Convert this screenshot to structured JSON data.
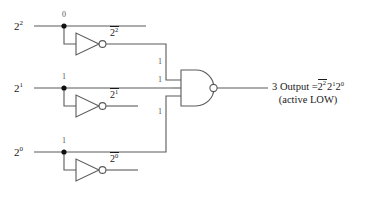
{
  "diagram": {
    "stroke_color": "#5a5a5a",
    "text_color": "#1a1a1a",
    "inputs": [
      {
        "label_base": "2",
        "label_exp": "2",
        "node_value": "0",
        "inverted_base": "2",
        "inverted_exp": "2"
      },
      {
        "label_base": "2",
        "label_exp": "1",
        "node_value": "1",
        "inverted_base": "2",
        "inverted_exp": "1"
      },
      {
        "label_base": "2",
        "label_exp": "0",
        "node_value": "1",
        "inverted_base": "2",
        "inverted_exp": "0"
      }
    ],
    "wire_values": [
      "1",
      "1",
      "1"
    ],
    "gate": {
      "type": "NAND",
      "inputs": 3,
      "bubble": true
    },
    "output": {
      "index": "3",
      "word": "Output",
      "equals": "=",
      "term1_base": "2",
      "term1_exp": "2",
      "term2_base": "2",
      "term2_exp": "1",
      "term3_base": "2",
      "term3_exp": "0",
      "note": "(active LOW)"
    }
  }
}
